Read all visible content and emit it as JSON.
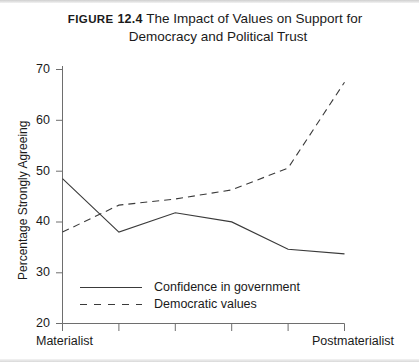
{
  "figure": {
    "label": "FIGURE",
    "number": "12.4",
    "title_line1": "The Impact of Values on Support for",
    "title_line2": "Democracy and Political Trust"
  },
  "chart_data": {
    "type": "line",
    "title": "The Impact of Values on Support for Democracy and Political Trust",
    "xlabel": "",
    "ylabel": "Percentage Strongly Agreeing",
    "ylim": [
      20,
      70
    ],
    "yticks": [
      20,
      30,
      40,
      50,
      60,
      70
    ],
    "ytick_labels": [
      "20",
      "30",
      "40",
      "50",
      "60",
      "70"
    ],
    "grid": false,
    "legend_position": "inside-bottom-left",
    "x": [
      1,
      2,
      3,
      4,
      5,
      6
    ],
    "x_axis_endpoint_labels": {
      "left": "Materialist",
      "right": "Postmaterialist"
    },
    "categories": [
      "Materialist",
      "",
      "",
      "",
      "",
      "Postmaterialist"
    ],
    "series": [
      {
        "name": "Confidence in government",
        "style": "solid",
        "color": "#3a3a3a",
        "values": [
          48.5,
          38.0,
          41.8,
          40.0,
          34.6,
          33.7
        ]
      },
      {
        "name": "Democratic values",
        "style": "dashed",
        "color": "#3a3a3a",
        "values": [
          38.0,
          43.3,
          44.5,
          46.3,
          50.6,
          67.5
        ]
      }
    ]
  },
  "legend": {
    "items": [
      {
        "label": "Confidence in government",
        "style": "solid"
      },
      {
        "label": "Democratic values",
        "style": "dashed"
      }
    ]
  },
  "axes": {
    "y_title": "Percentage Strongly Agreeing",
    "x_left_label": "Materialist",
    "x_right_label": "Postmaterialist"
  },
  "colors": {
    "ink": "#1a1a1a",
    "axis": "#6e6e6e",
    "series": "#3a3a3a",
    "background": "#ffffff"
  }
}
